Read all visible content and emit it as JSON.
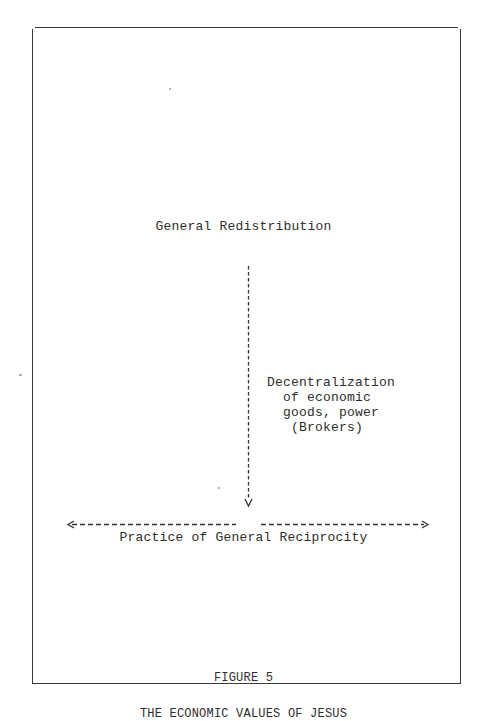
{
  "diagram": {
    "top_node": "General Redistribution",
    "vertical_arrow": {
      "direction": "down",
      "style": "dashed",
      "annotation_lines": [
        "Decentralization",
        "  of economic",
        "  goods, power",
        "   (Brokers)"
      ]
    },
    "horizontal_arrows": {
      "left": {
        "direction": "left",
        "style": "dashed"
      },
      "right": {
        "direction": "right",
        "style": "dashed"
      }
    },
    "bottom_node": "Practice of General Reciprocity"
  },
  "caption": {
    "figure_number": "FIGURE 5",
    "title": "THE ECONOMIC VALUES OF JESUS"
  },
  "colors": {
    "ink": "#2e2e2e",
    "frame": "#3a3a3a",
    "background": "#ffffff"
  }
}
